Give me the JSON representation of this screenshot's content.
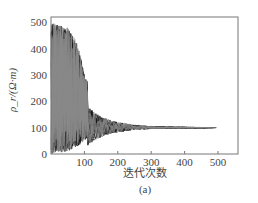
{
  "chart_data": {
    "type": "line",
    "title": "",
    "subtitle": "",
    "panel_label": "(a)",
    "xlabel": "迭代次数",
    "ylabel": "ρ_r/(Ω·m)",
    "xlim": [
      0,
      550
    ],
    "ylim": [
      0,
      520
    ],
    "x_ticks": [
      100,
      200,
      300,
      400,
      500
    ],
    "y_ticks": [
      0,
      100,
      200,
      300,
      400,
      500
    ],
    "grid": false,
    "legend": null,
    "series": [
      {
        "name": "envelope_max",
        "x": [
          0,
          20,
          50,
          80,
          100,
          130,
          160,
          200,
          250,
          300,
          400,
          500
        ],
        "values": [
          500,
          490,
          480,
          420,
          300,
          220,
          170,
          140,
          120,
          108,
          102,
          100
        ]
      },
      {
        "name": "envelope_min",
        "x": [
          0,
          20,
          50,
          80,
          100,
          130,
          160,
          200,
          250,
          300,
          400,
          500
        ],
        "values": [
          0,
          5,
          10,
          30,
          50,
          65,
          75,
          85,
          92,
          96,
          98,
          100
        ]
      },
      {
        "name": "converged_value",
        "x": [
          300,
          400,
          500
        ],
        "values": [
          100,
          100,
          100
        ]
      }
    ]
  },
  "labels": {
    "xlabel": "迭代次数",
    "ylabel": "ρ_r/(Ω·m)",
    "panel": "(a)",
    "y_ticks": [
      "0",
      "100",
      "200",
      "300",
      "400",
      "500"
    ],
    "x_ticks": [
      "100",
      "200",
      "300",
      "400",
      "500"
    ]
  }
}
